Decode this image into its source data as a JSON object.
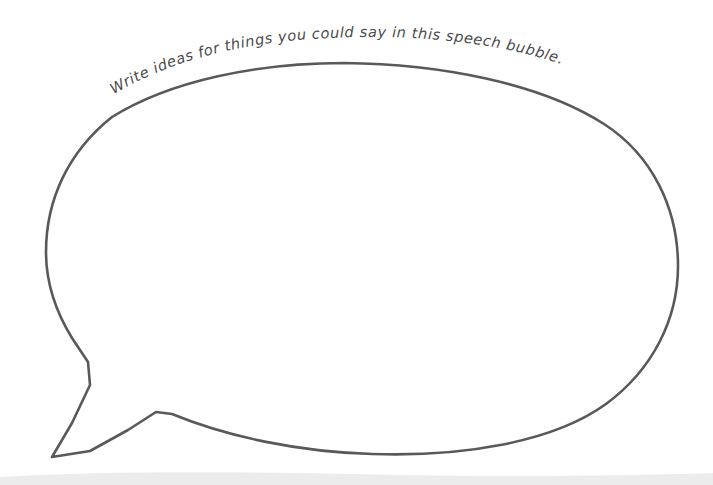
{
  "worksheet": {
    "title": "Speech Bubble Worksheet",
    "background_color": "#ffffff",
    "width": 713,
    "height": 485
  },
  "prompt": {
    "text": "Write ideas for things you could say in this speech bubble.",
    "color": "#4a4a4a",
    "style": "handwritten-curved",
    "placement": "arc above speech bubble top"
  },
  "speech_bubble": {
    "name": "speech-bubble",
    "shape": "oval with pointed tail at lower-left",
    "stroke_color": "#595959",
    "fill_color": "#ffffff",
    "stroke_width": 2.6,
    "is_blank": true,
    "bounds": {
      "left": 46,
      "right": 678,
      "top": 63,
      "bottom": 457
    },
    "tail": {
      "name": "speech-bubble-tail",
      "tip_x": 52,
      "tip_y": 457,
      "notch_x": 156,
      "notch_y": 412
    }
  },
  "page_edge": {
    "name": "page-bottom-edge",
    "color": "#ececec",
    "top_y": 472
  }
}
